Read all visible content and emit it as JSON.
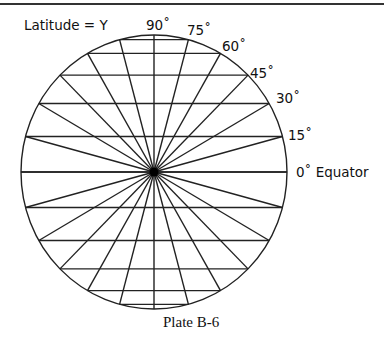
{
  "title_label": "Latitude = Y",
  "caption": "Plate B-6",
  "latitude_labels": [
    {
      "text": "90˚",
      "deg": 90
    },
    {
      "text": "75˚",
      "deg": 75
    },
    {
      "text": "60˚",
      "deg": 60
    },
    {
      "text": "45˚",
      "deg": 45
    },
    {
      "text": "30˚",
      "deg": 30
    },
    {
      "text": "15˚",
      "deg": 15
    },
    {
      "text": "0˚ Equator",
      "deg": 0
    }
  ],
  "diagram": {
    "shape": "circle",
    "parallels_deg": [
      75,
      60,
      45,
      30,
      15,
      0,
      -15,
      -30,
      -45,
      -60,
      -75
    ],
    "spoke_step_deg": 15,
    "line_color": "#222222",
    "center_dot": true
  }
}
